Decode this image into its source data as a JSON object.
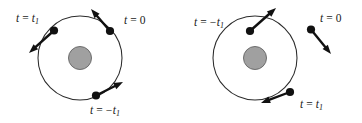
{
  "figure": {
    "background_color": "#ffffff",
    "width": 362,
    "height": 123
  },
  "colors": {
    "orbit_stroke": "#2b2b2b",
    "central_body_fill": "#a0a0a0",
    "central_body_stroke": "#6d6d6d",
    "marker_fill": "#111111",
    "arrow_color": "#111111",
    "label_color": "#1a1a1a"
  },
  "panels": [
    {
      "id": "left-panel",
      "name": "prograde-orbit-panel",
      "orbit": {
        "cx": 80,
        "cy": 58,
        "r": 42,
        "central_body_r": 11.5
      },
      "markers": [
        {
          "id": "left-t1",
          "name": "marker-t-equals-t1",
          "point": {
            "x": 54,
            "y": 30.5
          },
          "arrow_to": {
            "x": 29,
            "y": 53
          },
          "label": {
            "var": "t",
            "op": "=",
            "value": "t",
            "subscript": "1",
            "negative": false,
            "text": "t = t1",
            "x": 16,
            "y": 19,
            "anchor": "start"
          }
        },
        {
          "id": "left-t0",
          "name": "marker-t-equals-0",
          "point": {
            "x": 110,
            "y": 31
          },
          "arrow_to": {
            "x": 91,
            "y": 9
          },
          "label": {
            "var": "t",
            "op": "=",
            "value": "0",
            "subscript": "",
            "negative": false,
            "text": "t = 0",
            "x": 124,
            "y": 21,
            "anchor": "start"
          }
        },
        {
          "id": "left-minus-t1",
          "name": "marker-t-equals-minus-t1",
          "point": {
            "x": 96,
            "y": 95.5
          },
          "arrow_to": {
            "x": 123,
            "y": 82
          },
          "label": {
            "var": "t",
            "op": "=",
            "value": "t",
            "subscript": "1",
            "negative": true,
            "text": "t = -t1",
            "x": 90,
            "y": 111,
            "anchor": "start"
          }
        }
      ]
    },
    {
      "id": "right-panel",
      "name": "retrograde-orbit-panel",
      "orbit": {
        "cx": 255,
        "cy": 58,
        "r": 42,
        "central_body_r": 11.5
      },
      "markers": [
        {
          "id": "right-minus-t1",
          "name": "marker-t-equals-minus-t1",
          "point": {
            "x": 250,
            "y": 31
          },
          "arrow_to": {
            "x": 276,
            "y": 8
          },
          "label": {
            "var": "t",
            "op": "=",
            "value": "t",
            "subscript": "1",
            "negative": true,
            "text": "t = -t1",
            "x": 194,
            "y": 23,
            "anchor": "start"
          }
        },
        {
          "id": "right-t0",
          "name": "marker-t-equals-0",
          "point": {
            "x": 311,
            "y": 29.5
          },
          "arrow_to": {
            "x": 331,
            "y": 54
          },
          "label": {
            "var": "t",
            "op": "=",
            "value": "0",
            "subscript": "",
            "negative": false,
            "text": "t = 0",
            "x": 320,
            "y": 19,
            "anchor": "start"
          }
        },
        {
          "id": "right-t1",
          "name": "marker-t-equals-t1",
          "point": {
            "x": 290,
            "y": 92
          },
          "arrow_to": {
            "x": 261,
            "y": 103
          },
          "label": {
            "var": "t",
            "op": "=",
            "value": "t",
            "subscript": "1",
            "negative": false,
            "text": "t = t1",
            "x": 300,
            "y": 105,
            "anchor": "start"
          }
        }
      ]
    }
  ]
}
